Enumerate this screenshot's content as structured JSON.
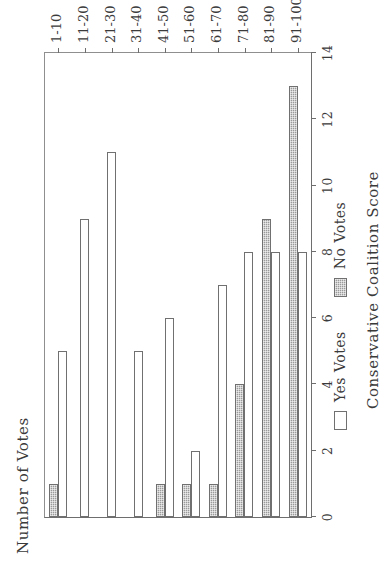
{
  "chart_data": {
    "type": "bar",
    "orientation": "horizontal-rotated",
    "title": "",
    "xlabel": "Conservative Coalition Score",
    "ylabel": "Number of Votes",
    "categories": [
      "1-10",
      "11-20",
      "21-30",
      "31-40",
      "41-50",
      "51-60",
      "61-70",
      "71-80",
      "81-90",
      "91-100"
    ],
    "series": [
      {
        "name": "Yes Votes",
        "fill": "#ffffff",
        "values": [
          5,
          9,
          11,
          5,
          6,
          2,
          7,
          8,
          8,
          8
        ]
      },
      {
        "name": "No Votes",
        "fill": "#9a9a9a",
        "values": [
          1,
          0,
          0,
          0,
          1,
          1,
          1,
          4,
          9,
          13
        ]
      }
    ],
    "ylim": [
      0,
      14
    ],
    "yticks": [
      0,
      2,
      4,
      6,
      8,
      10,
      12,
      14
    ],
    "ytick_labels": [
      "0",
      "2",
      "4",
      "6",
      "8",
      "10",
      "12",
      "14"
    ],
    "grid": false,
    "legend_position": "below-axes"
  },
  "legend": {
    "entries": [
      {
        "label": "Yes Votes",
        "style": "open"
      },
      {
        "label": "No Votes",
        "style": "hatched"
      }
    ]
  },
  "colors": {
    "axis": "#6e6e6e",
    "bar_outline": "#707070",
    "no_votes_fill": "#9a9a9a",
    "yes_votes_fill": "#ffffff",
    "text": "#3a3a3a",
    "background": "#ffffff"
  }
}
